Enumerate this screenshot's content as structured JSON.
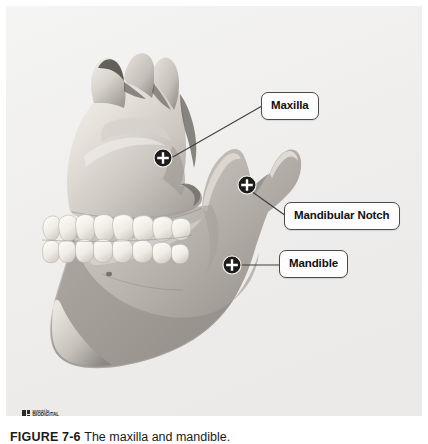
{
  "figure": {
    "background_color": "#f1f1f0",
    "page_background": "#ffffff",
    "modality": "3D anatomical render, grayscale",
    "view": "lateral view of human jaw (maxilla and mandible)"
  },
  "callouts": [
    {
      "id": "maxilla",
      "label": "Maxilla",
      "marker": "crosshair-plus",
      "marker_x": 163,
      "marker_y": 158,
      "box_x": 261,
      "box_y": 92
    },
    {
      "id": "mandibular-notch",
      "label": "Mandibular Notch",
      "marker": "crosshair-plus",
      "marker_x": 247,
      "marker_y": 185,
      "box_x": 284,
      "box_y": 202
    },
    {
      "id": "mandible",
      "label": "Mandible",
      "marker": "crosshair-plus",
      "marker_x": 232,
      "marker_y": 265,
      "box_x": 279,
      "box_y": 250
    }
  ],
  "logo": {
    "powered_by": "powered by",
    "brand": "BIODIGITAL",
    "icon": "biodigital-squares-logo"
  },
  "caption": {
    "number": "FIGURE 7-6",
    "text": "The maxilla and mandible."
  },
  "colors": {
    "label_border": "#4a4a4a",
    "label_fill": "#fdfdfd",
    "label_text": "#101010",
    "leader_line": "#3d3d3d",
    "marker_ring": "#1c1c1c",
    "marker_plus": "#ffffff",
    "bone_light": "#e9e6e0",
    "bone_mid": "#c9c5bf",
    "bone_dark": "#8f8b86",
    "tooth": "#f7f5f0"
  }
}
